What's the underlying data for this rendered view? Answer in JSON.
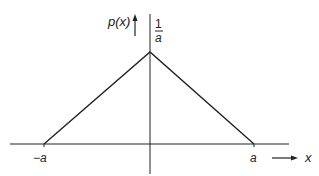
{
  "figure": {
    "type": "triangular probability density function",
    "y_axis_label": "p(x)",
    "x_axis_label": "x",
    "peak_label_numerator": "1",
    "peak_label_denominator": "a",
    "left_tick_label": "−a",
    "right_tick_label": "a",
    "colors": {
      "line": "#222222",
      "background": "#ffffff"
    }
  },
  "geometry": {
    "x_axis": {
      "x1": 10,
      "x2": 289,
      "y": 144
    },
    "y_axis": {
      "x": 150,
      "y1": 14,
      "y2": 174
    },
    "triangle": {
      "left": [
        44,
        144
      ],
      "peak": [
        150,
        52
      ],
      "right": [
        254,
        144
      ]
    }
  }
}
